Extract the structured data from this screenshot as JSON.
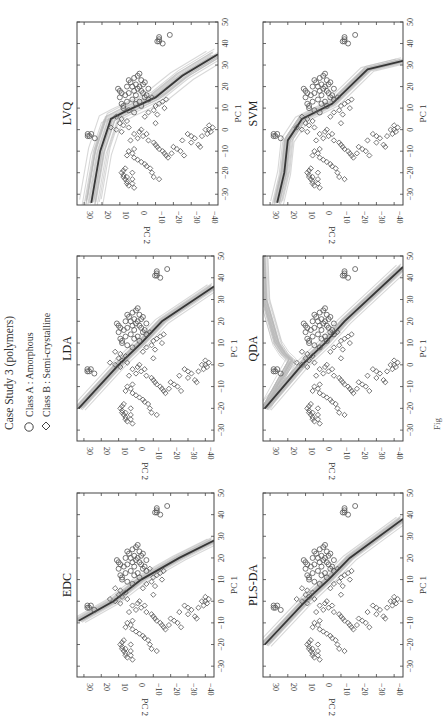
{
  "figure": {
    "orientation": "rotated 90 degrees counter-clockwise",
    "caption_fragment": "Fig",
    "legend": {
      "title": "Case Study 3 (polymers)",
      "items": [
        {
          "marker": "circle-icon",
          "label": "Class A : Amorphous"
        },
        {
          "marker": "diamond-icon",
          "label": "Class B : Semi-crystalline"
        }
      ]
    },
    "colors": {
      "marker_stroke": "#555555",
      "boundary_light": "#b8b8b8",
      "boundary_dark": "#202020",
      "axis": "#444444"
    }
  },
  "chart_data": [
    {
      "type": "scatter",
      "title": "EDC",
      "xlabel": "PC 1",
      "ylabel": "PC 2",
      "xlim": [
        -35,
        50
      ],
      "ylim": [
        -45,
        34
      ],
      "xticks": [
        -30,
        -20,
        -10,
        0,
        10,
        20,
        30,
        40,
        50
      ],
      "yticks": [
        -40,
        -30,
        -20,
        -10,
        0,
        10,
        20,
        30
      ],
      "boundary": {
        "kind": "linear-bootstrap",
        "points": [
          [
            -9,
            33
          ],
          [
            0,
            13
          ],
          [
            10,
            -3
          ],
          [
            20,
            -25
          ],
          [
            28,
            -45
          ]
        ]
      }
    },
    {
      "type": "scatter",
      "title": "PLS-DA",
      "xlabel": "PC 1",
      "ylabel": "PC 2",
      "xlim": [
        -35,
        50
      ],
      "ylim": [
        -45,
        34
      ],
      "xticks": [
        -30,
        -20,
        -10,
        0,
        10,
        20,
        30,
        40,
        50
      ],
      "yticks": [
        -40,
        -30,
        -20,
        -10,
        0,
        10,
        20,
        30
      ],
      "boundary": {
        "kind": "linear-bootstrap",
        "points": [
          [
            -20,
            33
          ],
          [
            0,
            10
          ],
          [
            10,
            -3
          ],
          [
            20,
            -15
          ],
          [
            38,
            -45
          ]
        ]
      }
    },
    {
      "type": "scatter",
      "title": "LDA",
      "xlabel": "PC 1",
      "ylabel": "PC 2",
      "xlim": [
        -35,
        50
      ],
      "ylim": [
        -45,
        34
      ],
      "xticks": [
        -30,
        -20,
        -10,
        0,
        10,
        20,
        30,
        40,
        50
      ],
      "yticks": [
        -40,
        -30,
        -20,
        -10,
        0,
        10,
        20,
        30
      ],
      "boundary": {
        "kind": "linear-bootstrap",
        "points": [
          [
            -20,
            33
          ],
          [
            0,
            10
          ],
          [
            10,
            -3
          ],
          [
            20,
            -15
          ],
          [
            36,
            -45
          ]
        ]
      }
    },
    {
      "type": "scatter",
      "title": "QDA",
      "xlabel": "PC 1",
      "ylabel": "PC 2",
      "xlim": [
        -35,
        50
      ],
      "ylim": [
        -45,
        34
      ],
      "xticks": [
        -30,
        -20,
        -10,
        0,
        10,
        20,
        30,
        40,
        50
      ],
      "yticks": [
        -40,
        -30,
        -20,
        -10,
        0,
        10,
        20,
        30
      ],
      "boundary": {
        "kind": "quadratic-bootstrap",
        "points": [
          [
            -20,
            33
          ],
          [
            0,
            12
          ],
          [
            10,
            -1
          ],
          [
            20,
            -12
          ],
          [
            45,
            -45
          ]
        ],
        "upper_branch": [
          [
            -20,
            33
          ],
          [
            2,
            18
          ],
          [
            5,
            22
          ],
          [
            10,
            26
          ],
          [
            30,
            33
          ],
          [
            50,
            34
          ]
        ]
      }
    },
    {
      "type": "scatter",
      "title": "LVQ",
      "xlabel": "PC 1",
      "ylabel": "PC 2",
      "xlim": [
        -35,
        50
      ],
      "ylim": [
        -45,
        34
      ],
      "xticks": [
        -30,
        -20,
        -10,
        0,
        10,
        20,
        30,
        40,
        50
      ],
      "yticks": [
        -40,
        -30,
        -20,
        -10,
        0,
        10,
        20,
        30
      ],
      "boundary": {
        "kind": "piecewise-bootstrap",
        "points": [
          [
            -34,
            26
          ],
          [
            -10,
            21
          ],
          [
            5,
            15
          ],
          [
            8,
            8
          ],
          [
            15,
            -10
          ],
          [
            25,
            -25
          ],
          [
            35,
            -45
          ]
        ]
      }
    },
    {
      "type": "scatter",
      "title": "SVM",
      "xlabel": "PC 1",
      "ylabel": "PC 2",
      "xlim": [
        -35,
        50
      ],
      "ylim": [
        -45,
        34
      ],
      "xticks": [
        -30,
        -20,
        -10,
        0,
        10,
        20,
        30,
        40,
        50
      ],
      "yticks": [
        -40,
        -30,
        -20,
        -10,
        0,
        10,
        20,
        30
      ],
      "boundary": {
        "kind": "nonlinear-bootstrap",
        "points": [
          [
            -34,
            26
          ],
          [
            -20,
            22
          ],
          [
            -5,
            20
          ],
          [
            5,
            12
          ],
          [
            12,
            -5
          ],
          [
            20,
            -15
          ],
          [
            28,
            -25
          ],
          [
            32,
            -45
          ]
        ]
      }
    }
  ],
  "scatter_points": {
    "class_a_amorphous": [
      [
        42,
        -12
      ],
      [
        43,
        -12
      ],
      [
        41,
        -11
      ],
      [
        41,
        -12
      ],
      [
        40,
        -14
      ],
      [
        44,
        -18
      ],
      [
        25,
        0
      ],
      [
        24,
        2
      ],
      [
        23,
        -2
      ],
      [
        22,
        4
      ],
      [
        21,
        1
      ],
      [
        20,
        3
      ],
      [
        20,
        -1
      ],
      [
        19,
        0
      ],
      [
        18,
        2
      ],
      [
        17,
        5
      ],
      [
        17,
        -3
      ],
      [
        16,
        7
      ],
      [
        16,
        1
      ],
      [
        15,
        -4
      ],
      [
        14,
        3
      ],
      [
        13,
        6
      ],
      [
        12,
        9
      ],
      [
        12,
        1
      ],
      [
        11,
        -2
      ],
      [
        10,
        8
      ],
      [
        9,
        5
      ],
      [
        8,
        2
      ],
      [
        22,
        -4
      ],
      [
        19,
        -6
      ],
      [
        18,
        10
      ],
      [
        15,
        10
      ],
      [
        14,
        -6
      ],
      [
        20,
        6
      ],
      [
        23,
        5
      ],
      [
        26,
        -1
      ],
      [
        18,
        -2
      ],
      [
        21,
        -3
      ],
      [
        16,
        -5
      ],
      [
        13,
        -1
      ],
      [
        19,
        11
      ],
      [
        11,
        8
      ],
      [
        17,
        9
      ],
      [
        -3,
        27
      ],
      [
        -2,
        28
      ],
      [
        -3,
        28
      ],
      [
        -2,
        26
      ],
      [
        -4,
        24
      ]
    ],
    "class_b_semicrystalline": [
      [
        -20,
        9
      ],
      [
        -21,
        8
      ],
      [
        -22,
        8
      ],
      [
        -23,
        7
      ],
      [
        -24,
        6
      ],
      [
        -25,
        6
      ],
      [
        -26,
        5
      ],
      [
        -22,
        6
      ],
      [
        -19,
        8
      ],
      [
        -18,
        7
      ],
      [
        -27,
        2
      ],
      [
        -23,
        3
      ],
      [
        -20,
        3
      ],
      [
        -25,
        3
      ],
      [
        -10,
        5
      ],
      [
        -11,
        3
      ],
      [
        -13,
        2
      ],
      [
        -12,
        6
      ],
      [
        -9,
        2
      ],
      [
        -14,
        0
      ],
      [
        -15,
        -2
      ],
      [
        -16,
        -4
      ],
      [
        -17,
        -5
      ],
      [
        -18,
        -7
      ],
      [
        -20,
        -8
      ],
      [
        -22,
        -9
      ],
      [
        -23,
        -12
      ],
      [
        -5,
        -6
      ],
      [
        -6,
        -9
      ],
      [
        -7,
        -10
      ],
      [
        -8,
        -11
      ],
      [
        -9,
        -12
      ],
      [
        -10,
        -14
      ],
      [
        -11,
        -15
      ],
      [
        -12,
        -16
      ],
      [
        -13,
        -17
      ],
      [
        -2,
        2
      ],
      [
        -1,
        -1
      ],
      [
        -3,
        -3
      ],
      [
        -4,
        0
      ],
      [
        -5,
        4
      ],
      [
        0,
        -2
      ],
      [
        1,
        5
      ],
      [
        -2,
        -5
      ],
      [
        2,
        8
      ],
      [
        3,
        10
      ],
      [
        4,
        6
      ],
      [
        5,
        9
      ],
      [
        6,
        12
      ],
      [
        -1,
        9
      ],
      [
        0,
        12
      ],
      [
        1,
        15
      ],
      [
        -8,
        -20
      ],
      [
        -9,
        -22
      ],
      [
        -10,
        -24
      ],
      [
        -11,
        -19
      ],
      [
        -12,
        -26
      ],
      [
        -5,
        -25
      ],
      [
        -3,
        -30
      ],
      [
        -4,
        -32
      ],
      [
        -6,
        -30
      ],
      [
        -7,
        -34
      ],
      [
        -8,
        -35
      ],
      [
        -2,
        -28
      ],
      [
        0,
        -40
      ],
      [
        1,
        -42
      ],
      [
        -1,
        -41
      ],
      [
        0,
        -38
      ],
      [
        2,
        -40
      ],
      [
        -2,
        -39
      ],
      [
        -3,
        -36
      ],
      [
        12,
        -12
      ],
      [
        13,
        -14
      ],
      [
        11,
        -10
      ],
      [
        14,
        -16
      ],
      [
        10,
        -15
      ],
      [
        8,
        -6
      ],
      [
        7,
        -11
      ],
      [
        3,
        -10
      ],
      [
        9,
        -9
      ],
      [
        15,
        -8
      ],
      [
        6,
        -4
      ]
    ]
  }
}
